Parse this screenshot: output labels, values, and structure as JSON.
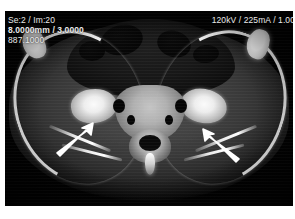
{
  "modality": "CT",
  "overlay": {
    "left_lines": [
      "Se:2 / Im:20",
      "8.0000mm / 3.0000",
      "887.1000"
    ],
    "right_lines": [
      "120kV / 225mA / 1.00"
    ],
    "series_label": "Se:2 / Im:20",
    "thickness_label": "8.0000mm / 3.0000",
    "window_label": "887.1000",
    "technique_label": "120kV / 225mA / 1.00"
  },
  "annotations": [
    {
      "name": "arrow-left-si-joint",
      "points_to": "right sacroiliac joint",
      "direction": "up-right"
    },
    {
      "name": "arrow-right-si-joint",
      "points_to": "left sacroiliac joint",
      "direction": "up-left"
    }
  ],
  "image": {
    "description": "Axial CT section through the pelvis at the level of the sacroiliac joints",
    "background_color": "#020202",
    "bone_color": "#ffffff",
    "soft_tissue_color": "#454545",
    "annotation_color": "#ffffff",
    "overlay_text_color": "#e9e9e9"
  }
}
